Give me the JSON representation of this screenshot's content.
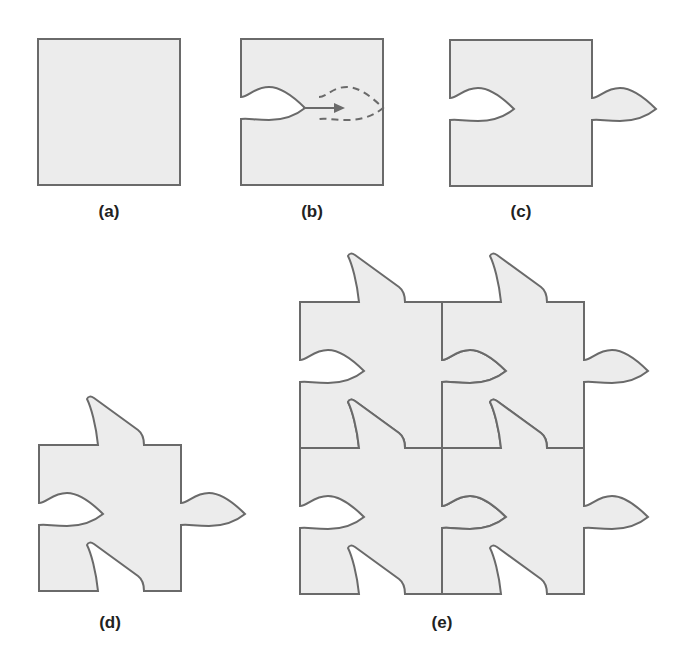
{
  "figure": {
    "panels": [
      {
        "id": "a",
        "label": "(a)",
        "description": "Plain square tile"
      },
      {
        "id": "b",
        "label": "(b)",
        "description": "Cut-out on left edge translated to right edge (dashed outline, arrow)"
      },
      {
        "id": "c",
        "label": "(c)",
        "description": "Square with left indent and matching right tab"
      },
      {
        "id": "d",
        "label": "(d)",
        "description": "Tile with additional top tab and matching bottom indent"
      },
      {
        "id": "e",
        "label": "(e)",
        "description": "2x2 tessellation of the modified tile"
      }
    ],
    "colors": {
      "fill": "#ececec",
      "stroke": "#6a6a6a",
      "label": "#222222",
      "background": "#ffffff"
    }
  }
}
